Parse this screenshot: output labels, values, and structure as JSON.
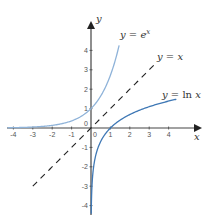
{
  "chart_data": {
    "type": "line",
    "title": "",
    "xlabel": "x",
    "ylabel": "y",
    "xlim": [
      -4.3,
      5.8
    ],
    "ylim": [
      -4.5,
      5.7
    ],
    "grid": false,
    "x_ticks": [
      -4,
      -3,
      -2,
      -1,
      0,
      1,
      2,
      3,
      4
    ],
    "y_ticks": [
      -4,
      -3,
      -2,
      -1,
      0,
      1,
      2,
      3,
      4
    ],
    "x_tick_labels": [
      "-4",
      "-3",
      "-2",
      "-1",
      "0",
      "1",
      "2",
      "3",
      "4"
    ],
    "y_tick_labels": [
      "-4",
      "-3",
      "-2",
      "-1",
      "0",
      "1",
      "2",
      "3",
      "4"
    ],
    "series": [
      {
        "name": "y = e^x",
        "label": "y = e",
        "label_sup": "x",
        "function": "exp",
        "x_range": [
          -4.3,
          1.45
        ],
        "color": "#8fb3d9",
        "style": "solid",
        "sample_points": [
          [
            -4,
            0.018
          ],
          [
            -3,
            0.05
          ],
          [
            -2,
            0.135
          ],
          [
            -1,
            0.368
          ],
          [
            0,
            1
          ],
          [
            1,
            2.718
          ],
          [
            1.45,
            4.26
          ]
        ]
      },
      {
        "name": "y = x",
        "label": "y = x",
        "function": "identity",
        "x_range": [
          -3,
          3.35
        ],
        "color": "#222222",
        "style": "dashed",
        "sample_points": [
          [
            -3,
            -3
          ],
          [
            0,
            0
          ],
          [
            3.35,
            3.35
          ]
        ]
      },
      {
        "name": "y = ln x",
        "label": "y = ln x",
        "function": "log",
        "x_range": [
          0.012,
          4.4
        ],
        "color": "#3f78b5",
        "style": "solid",
        "sample_points": [
          [
            0.02,
            -3.9
          ],
          [
            0.1,
            -2.3
          ],
          [
            0.5,
            -0.69
          ],
          [
            1,
            0
          ],
          [
            2,
            0.69
          ],
          [
            3,
            1.1
          ],
          [
            4,
            1.39
          ],
          [
            4.4,
            1.48
          ]
        ]
      }
    ],
    "annotations": [
      {
        "text": "y = e^x",
        "near": [
          1.5,
          4.7
        ]
      },
      {
        "text": "y = x",
        "near": [
          3.4,
          3.7
        ]
      },
      {
        "text": "y = ln x",
        "near": [
          3.7,
          1.75
        ]
      }
    ]
  },
  "labels": {
    "x_axis": "x",
    "y_axis": "y",
    "exp_label_main": "y = e",
    "exp_label_sup": "x",
    "identity_label": "y = x",
    "log_label_main": "y = ",
    "log_label_ln": "ln",
    "log_label_var": " x",
    "origin_y": "0",
    "origin_x": "0"
  }
}
